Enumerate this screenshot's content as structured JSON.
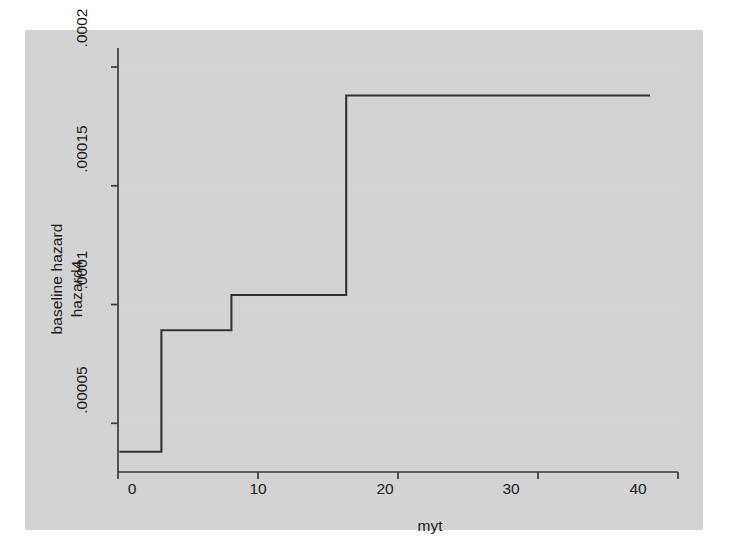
{
  "figure": {
    "background_color": "#d3d3d3",
    "plot_background_color": "#ffffff",
    "line_color": "#333333",
    "grid_color": "#d8d8d8",
    "axis_color": "#3a3a3a"
  },
  "chart_data": {
    "type": "line",
    "line_style": "step-post",
    "title": "",
    "xlabel": "myt",
    "ylabel": "hazard4",
    "ylabel_outer": "baseline hazard",
    "xlim": [
      0,
      40
    ],
    "ylim": [
      2.95e-05,
      0.000208
    ],
    "xticks": [
      0,
      10,
      20,
      30,
      40
    ],
    "xticklabels": [
      "0",
      "10",
      "20",
      "30",
      "40"
    ],
    "yticks": [
      5e-05,
      0.0001,
      0.00015,
      0.0002
    ],
    "yticklabels": [
      ".00005",
      ".0001",
      ".00015",
      ".0002"
    ],
    "grid": true,
    "grid_axis": "y",
    "legend": null,
    "series": [
      {
        "name": "baseline hazard",
        "x": [
          0.1,
          3.1,
          3.1,
          8.1,
          8.1,
          16.3,
          16.3,
          38.0
        ],
        "y": [
          3.8e-05,
          3.8e-05,
          8.92e-05,
          8.92e-05,
          0.000104,
          0.000104,
          0.000188,
          0.000188
        ],
        "steps": [
          {
            "x_start": 0.1,
            "x_end": 3.1,
            "value": 3.8e-05
          },
          {
            "x_start": 3.1,
            "x_end": 8.1,
            "value": 8.92e-05
          },
          {
            "x_start": 8.1,
            "x_end": 16.3,
            "value": 0.000104
          },
          {
            "x_start": 16.3,
            "x_end": 38.0,
            "value": 0.000188
          }
        ]
      }
    ]
  }
}
